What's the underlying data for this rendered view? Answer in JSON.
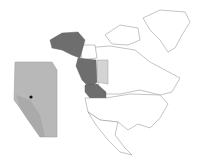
{
  "map": {
    "type": "locator-map",
    "region": "North America",
    "highlighted_dark": [
      "Alaska",
      "British Columbia",
      "Washington",
      "Idaho",
      "Montana"
    ],
    "highlighted_light": [
      "Alberta"
    ],
    "inset": {
      "region": "Alberta",
      "marker": "location-dot"
    },
    "colors": {
      "dark": "#6e6e6e",
      "light": "#d4d4d4",
      "inset_fill": "#b8b8b8",
      "outline": "#9a9a9a",
      "marker": "#111111"
    }
  }
}
